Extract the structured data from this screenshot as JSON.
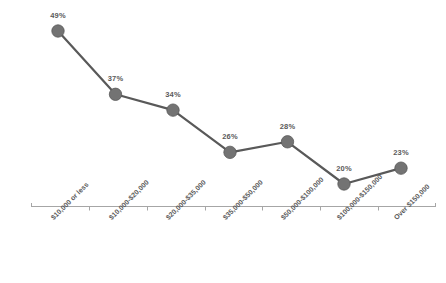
{
  "chart_data": {
    "type": "line",
    "title": "",
    "subtitle": "",
    "xlabel": "",
    "ylabel": "",
    "grid": false,
    "legend": false,
    "legend_position": "none",
    "ylim": [
      0,
      55
    ],
    "categories": [
      "$10,000 or less",
      "$10,000-$20,000",
      "$20,000-$35,000",
      "$35,000-$50,000",
      "$50,000-$100,000",
      "$100,000-$150,000",
      "Over $150,000"
    ],
    "values": [
      49,
      37,
      34,
      26,
      28,
      20,
      23
    ],
    "data_labels": [
      "49%",
      "37%",
      "34%",
      "26%",
      "28%",
      "20%",
      "23%"
    ],
    "series": [
      {
        "name": "",
        "values": [
          49,
          37,
          34,
          26,
          28,
          20,
          23
        ],
        "color": "#595959",
        "marker": "circle",
        "marker_color": "#737373"
      }
    ],
    "axis": {
      "line_color": "#a6a6a6",
      "tick_color": "#a6a6a6",
      "tick_labels_rotation": -45
    },
    "colors": {
      "line": "#595959",
      "marker_fill": "#737373",
      "marker_stroke": "#595959",
      "label_text": "#5a5a5a",
      "axis": "#a6a6a6",
      "background": "#ffffff"
    }
  }
}
